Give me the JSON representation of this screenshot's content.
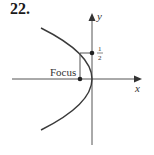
{
  "problem_number": "22.",
  "diagram": {
    "type": "parabola",
    "opens": "left",
    "axes": {
      "x_label": "x",
      "y_label": "y"
    },
    "labels": {
      "focus": "Focus",
      "point_y_numerator": "1",
      "point_y_denominator": "2"
    },
    "colors": {
      "curve": "#3a3a3a",
      "axes": "#555555",
      "text": "#333333"
    }
  }
}
